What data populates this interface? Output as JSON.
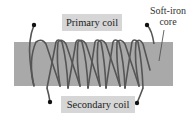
{
  "diagram": {
    "type": "transformer",
    "labels": {
      "primary_coil": "Primary coil",
      "secondary_coil": "Secondary coil",
      "core_line1": "Soft-iron",
      "core_line2": "core"
    },
    "colors": {
      "core_fill": "#a9a9a9",
      "wire": "#555555",
      "label_bg": "#d6d6d6",
      "terminal_dot": "#111111"
    },
    "primary_coil": {
      "turns": 6,
      "terminals": [
        "left",
        "right"
      ]
    },
    "secondary_coil": {
      "turns": 6,
      "terminals": [
        "left",
        "right"
      ]
    }
  }
}
